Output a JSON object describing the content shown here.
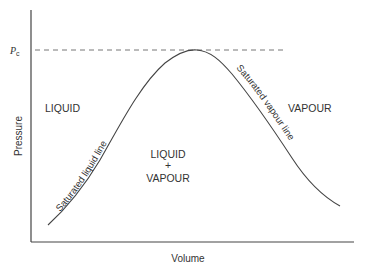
{
  "diagram": {
    "type": "pv-saturation-dome",
    "axes": {
      "xlabel": "Volume",
      "ylabel": "Pressure"
    },
    "critical_pressure": {
      "symbol": "P",
      "subscript": "c",
      "line_style": "dashed"
    },
    "regions": {
      "liquid": "LIQUID",
      "vapour": "VAPOUR",
      "mixed_top": "LIQUID",
      "mixed_mid": "+",
      "mixed_bottom": "VAPOUR"
    },
    "curves": {
      "saturated_liquid": "Saturated liquid line",
      "saturated_vapour": "Saturated vapour line"
    },
    "colors": {
      "ink": "#333333",
      "dashed": "#777777",
      "background": "#ffffff"
    }
  }
}
